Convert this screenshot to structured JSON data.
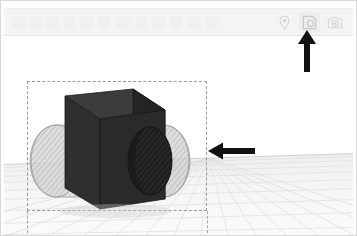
{
  "app": {
    "title": "3D Modeling Viewport",
    "background_color": "#ffffff"
  },
  "toolbar": {
    "background_color": "#f4f4f4",
    "icons": [
      {
        "name": "location-pin-icon",
        "label": "Pin",
        "state": "inactive",
        "color": "#d9d9d9"
      },
      {
        "name": "shape-tool-icon",
        "label": "Shape Tool",
        "state": "active",
        "color": "#c9c9c9"
      },
      {
        "name": "camera-icon",
        "label": "Camera",
        "state": "inactive",
        "color": "#d9d9d9"
      }
    ]
  },
  "viewport": {
    "grid": {
      "visible": true,
      "line_color": "#dcdcdc",
      "horizon_color": "#cfcfcf",
      "ground_color": "#f2f2f2"
    },
    "selection": {
      "visible": true,
      "style": "dashed",
      "color": "#9a9a9a",
      "x": 23,
      "y": 44,
      "width": 180,
      "height": 130
    },
    "objects": [
      {
        "name": "box-solid",
        "type": "box",
        "color": "#2d2d2d",
        "top_face_color": "#3a3a3a",
        "side_face_color": "#262626",
        "selected": true
      },
      {
        "name": "cylinder-cut",
        "type": "cylinder",
        "color": "#c4c4c4",
        "opacity": 0.55,
        "hatched": true,
        "axis": "horizontal",
        "protrudes": "both-sides"
      }
    ]
  },
  "annotations": [
    {
      "name": "arrow-left-annotation",
      "direction": "left",
      "color": "#111111",
      "points_at": "cylinder-cut"
    },
    {
      "name": "arrow-up-annotation",
      "direction": "up",
      "color": "#111111",
      "points_at": "shape-tool-icon"
    }
  ]
}
